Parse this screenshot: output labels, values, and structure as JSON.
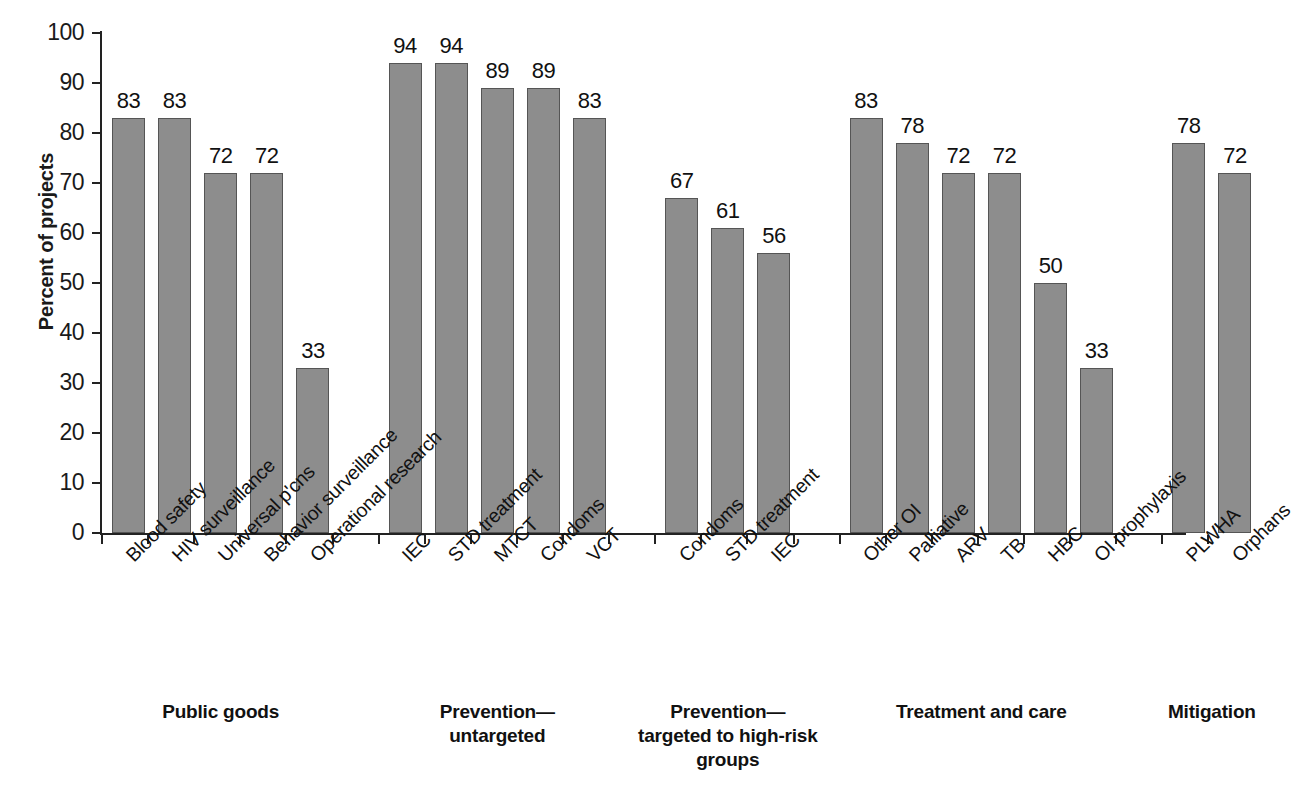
{
  "chart_data": {
    "type": "bar",
    "title": "",
    "xlabel": "",
    "ylabel": "Percent of projects",
    "ylim": [
      0,
      100
    ],
    "ytick_step": 10,
    "yticks": [
      100,
      90,
      80,
      70,
      60,
      50,
      40,
      30,
      20,
      10,
      0
    ],
    "grid": false,
    "legend": "none",
    "bar_color": "#8d8d8d",
    "bar_edge_color": "#555555",
    "axis_color": "#222222",
    "value_labels_shown": true,
    "categories": [
      "Blood safety",
      "HIV surveillance",
      "Universal p'cns",
      "Behavior surveillance",
      "Operational research",
      "IEC",
      "STD treatment",
      "MTCT",
      "Condoms",
      "VCT",
      "Condoms",
      "STD treatment",
      "IEC",
      "Other OI",
      "Palliative",
      "ARV",
      "TB",
      "HBC",
      "OI prophylaxis",
      "PLWHA",
      "Orphans"
    ],
    "values": [
      83,
      83,
      72,
      72,
      33,
      94,
      94,
      89,
      89,
      83,
      67,
      61,
      56,
      83,
      78,
      72,
      72,
      50,
      33,
      78,
      72
    ],
    "groups": [
      {
        "label": "Public goods",
        "label_lines": [
          "Public goods"
        ],
        "categories": [
          "Blood safety",
          "HIV surveillance",
          "Universal p'cns",
          "Behavior surveillance",
          "Operational research"
        ],
        "values": [
          83,
          83,
          72,
          72,
          33
        ]
      },
      {
        "label": "Prevention—untargeted",
        "label_lines": [
          "Prevention—",
          "untargeted"
        ],
        "categories": [
          "IEC",
          "STD treatment",
          "MTCT",
          "Condoms",
          "VCT"
        ],
        "values": [
          94,
          94,
          89,
          89,
          83
        ]
      },
      {
        "label": "Prevention—targeted to high-risk groups",
        "label_lines": [
          "Prevention—",
          "targeted to high-risk",
          "groups"
        ],
        "categories": [
          "Condoms",
          "STD treatment",
          "IEC"
        ],
        "values": [
          67,
          61,
          56
        ]
      },
      {
        "label": "Treatment and care",
        "label_lines": [
          "Treatment and care"
        ],
        "categories": [
          "Other OI",
          "Palliative",
          "ARV",
          "TB",
          "HBC",
          "OI prophylaxis"
        ],
        "values": [
          83,
          78,
          72,
          72,
          50,
          33
        ]
      },
      {
        "label": "Mitigation",
        "label_lines": [
          "Mitigation"
        ],
        "categories": [
          "PLWHA",
          "Orphans"
        ],
        "values": [
          78,
          72
        ]
      }
    ]
  }
}
